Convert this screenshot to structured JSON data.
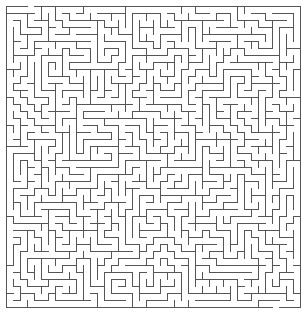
{
  "maze": {
    "left": 6,
    "top": 6,
    "cols": 42,
    "rows": 43,
    "cell": 7,
    "wall_color": "#555555",
    "background": "#ffffff",
    "stroke_width": 1,
    "seed": 20240601,
    "entrance": {
      "side": "top",
      "col": 3
    },
    "exit": {
      "side": "bottom",
      "col": 38
    }
  }
}
